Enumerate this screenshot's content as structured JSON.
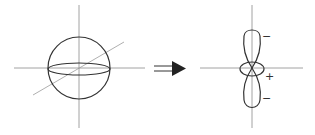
{
  "diagram": {
    "colors": {
      "stroke": "#333333",
      "axis": "#888888",
      "background": "#ffffff"
    },
    "left_figure": {
      "name": "sphere-with-axes",
      "center": [
        79,
        68
      ],
      "radius": 31
    },
    "arrow": {
      "type": "double-arrow",
      "symbol": "⇒"
    },
    "right_figure": {
      "name": "dz2-orbital",
      "center": [
        252,
        68
      ],
      "signs": {
        "upper_lobe": "−",
        "torus": "+",
        "lower_lobe": "−"
      }
    }
  }
}
